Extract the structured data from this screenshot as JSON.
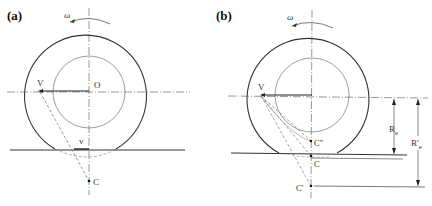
{
  "figure": {
    "panels": [
      {
        "id": "a",
        "label": "(a)",
        "omega_label": "ω",
        "center_label": "O",
        "point_V_label": "V",
        "point_v_label": "v",
        "point_C_label": "C"
      },
      {
        "id": "b",
        "label": "(b)",
        "omega_label": "ω",
        "point_V_label": "V",
        "point_C2_label": "C\"",
        "point_C_label": "C",
        "point_C1_label": "C'",
        "re_label": "R",
        "re_sub": "e",
        "re_prime_label": "R'",
        "re_prime_sub": "e"
      }
    ],
    "colors": {
      "line": "#333333",
      "thin_line": "#777777",
      "background": "#ffffff"
    }
  }
}
